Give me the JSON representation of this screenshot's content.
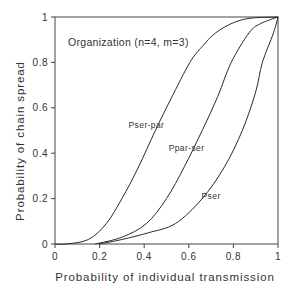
{
  "chart_data": {
    "type": "line",
    "title": "",
    "annotation": "Organization (n=4, m=3)",
    "xlabel": "Probability of individual transmission",
    "ylabel": "Probability of chain spread",
    "xlim": [
      0,
      1
    ],
    "ylim": [
      0,
      1
    ],
    "xticks": [
      "0",
      "0.2",
      "0.4",
      "0.6",
      "0.8",
      "1"
    ],
    "yticks": [
      "0",
      "0.2",
      "0.4",
      "0.6",
      "0.8",
      "1"
    ],
    "grid": false,
    "legend": "inline labels",
    "series": [
      {
        "name": "Pser-par",
        "x": [
          0,
          0.05,
          0.15,
          0.23,
          0.3,
          0.37,
          0.45,
          0.52,
          0.605,
          0.66,
          0.72,
          0.8,
          0.88,
          1.0
        ],
        "y": [
          0,
          0,
          0.02,
          0.09,
          0.2,
          0.33,
          0.5,
          0.64,
          0.8,
          0.87,
          0.93,
          0.975,
          0.995,
          1.0
        ]
      },
      {
        "name": "Ppar-ser",
        "x": [
          0.18,
          0.3,
          0.41,
          0.5,
          0.58,
          0.66,
          0.73,
          0.79,
          0.87,
          0.92,
          1.0
        ],
        "y": [
          0,
          0.03,
          0.09,
          0.2,
          0.34,
          0.5,
          0.65,
          0.8,
          0.93,
          0.97,
          1.0
        ]
      },
      {
        "name": "Pser",
        "x": [
          0.2,
          0.3,
          0.42,
          0.54,
          0.66,
          0.76,
          0.84,
          0.9,
          0.93,
          0.98,
          1.0
        ],
        "y": [
          0,
          0.02,
          0.05,
          0.09,
          0.2,
          0.34,
          0.5,
          0.67,
          0.8,
          0.93,
          1.0
        ]
      }
    ],
    "series_labels": [
      {
        "name": "Pser-par",
        "x": 0.41,
        "y": 0.51
      },
      {
        "name": "Ppar-ser",
        "x": 0.59,
        "y": 0.41
      },
      {
        "name": "Pser",
        "x": 0.7,
        "y": 0.2
      }
    ]
  }
}
